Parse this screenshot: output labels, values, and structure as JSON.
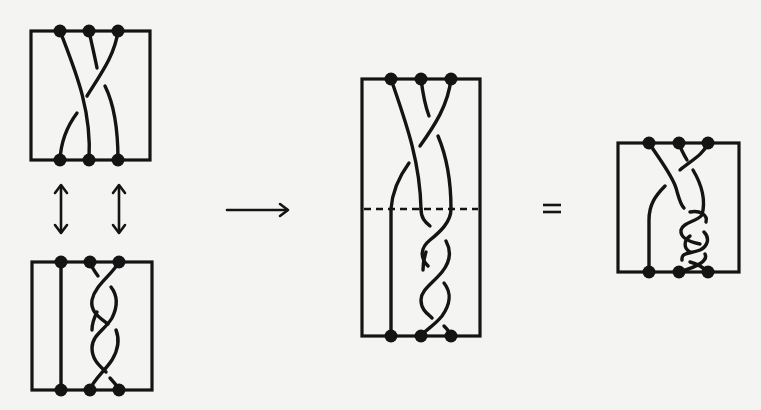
{
  "figure": {
    "stroke_color": "#141414",
    "background_color": "#f4f4f2",
    "panels": [
      {
        "id": "braid-top-left",
        "box": [
          31,
          31,
          150,
          160
        ],
        "points_top": [
          60,
          89,
          118
        ],
        "points_bottom": [
          60,
          89,
          118
        ]
      },
      {
        "id": "braid-bottom-left",
        "box": [
          32,
          262,
          152,
          390
        ],
        "points_top": [
          61,
          90,
          119
        ],
        "points_bottom": [
          61,
          90,
          119
        ]
      },
      {
        "id": "braid-composite",
        "box": [
          362,
          79,
          480,
          336
        ],
        "points_top": [
          391,
          421,
          451
        ],
        "points_bottom": [
          391,
          421,
          451
        ],
        "dashed_divider_y": 209
      },
      {
        "id": "braid-result",
        "box": [
          618,
          143,
          739,
          272
        ],
        "points_top": [
          649,
          679,
          708
        ],
        "points_bottom": [
          649,
          679,
          708
        ]
      }
    ],
    "symbols": {
      "double_arrows": "↕",
      "composition_arrow": "⟶",
      "equals": "="
    }
  }
}
